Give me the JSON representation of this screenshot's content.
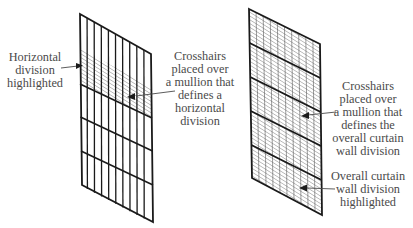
{
  "left_panel": {
    "callouts": [
      {
        "id": "horizontal-division-highlighted",
        "lines": [
          "Horizontal",
          "division",
          "highlighted"
        ],
        "align": "center"
      },
      {
        "id": "crosshairs-horizontal-division",
        "lines": [
          "Crosshairs",
          "placed over",
          "a mullion that",
          "defines a",
          "horizontal",
          "division"
        ],
        "align": "center"
      }
    ]
  },
  "right_panel": {
    "callouts": [
      {
        "id": "crosshairs-overall-division",
        "lines": [
          "Crosshairs",
          "placed over",
          "a mullion that",
          "defines the",
          "overall curtain",
          "wall division"
        ],
        "align": "center"
      },
      {
        "id": "overall-division-highlighted",
        "lines": [
          "Overall curtain",
          "wall division",
          "highlighted"
        ],
        "align": "center"
      }
    ]
  },
  "colors": {
    "line": "#1a1a1a",
    "hatch": "#6e6e6e",
    "text": "#4a4a4a"
  }
}
